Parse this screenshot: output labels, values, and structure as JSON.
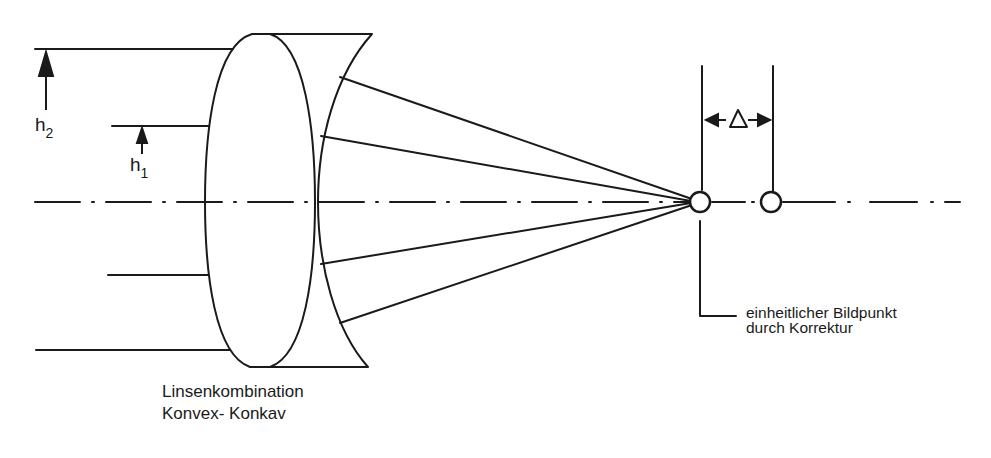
{
  "diagram": {
    "type": "optical-lens-correction",
    "stroke_color": "#1a1a1a",
    "background": "#ffffff",
    "labels": {
      "h2_main": "h",
      "h2_sub": "2",
      "h1_main": "h",
      "h1_sub": "1",
      "delta": "Δ",
      "lens_caption_line1": "Linsenkombination",
      "lens_caption_line2": "Konvex- Konkav",
      "image_point_line1": "einheitlicher Bildpunkt",
      "image_point_line2": "durch Korrektur"
    },
    "elements": {
      "optical_axis_y": 202,
      "incoming_rays": [
        {
          "y": 49,
          "x_start": 35,
          "x_end": 232
        },
        {
          "y": 126,
          "x_start": 112,
          "x_end": 209
        },
        {
          "y": 275,
          "x_start": 108,
          "x_end": 209
        },
        {
          "y": 350,
          "x_start": 36,
          "x_end": 230
        }
      ],
      "focal_point_corrected": {
        "x": 700,
        "y": 202,
        "r": 10
      },
      "focal_point_uncorrected": {
        "x": 771,
        "y": 202,
        "r": 10
      }
    }
  }
}
